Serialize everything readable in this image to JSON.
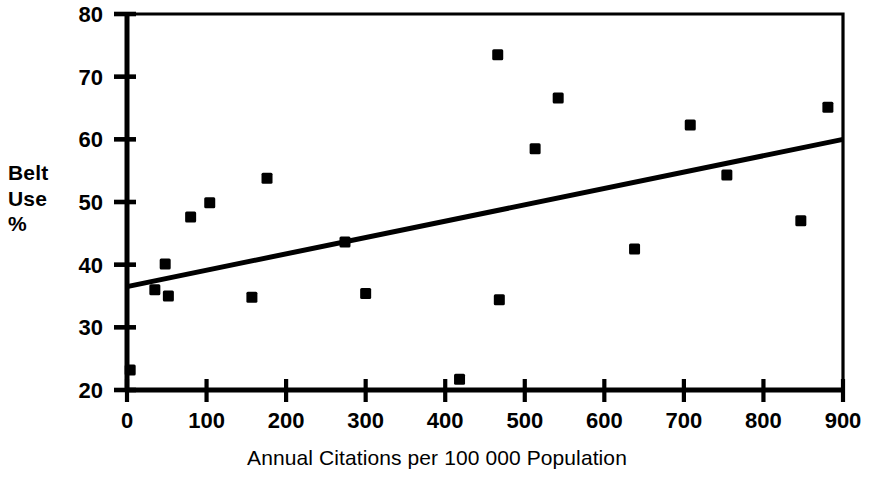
{
  "chart_data": {
    "type": "scatter",
    "title": "",
    "subtitle": "",
    "xlabel": "Annual Citations per 100 000 Population",
    "ylabel": "Belt Use %",
    "ylabel_lines": [
      "Belt",
      "Use",
      "%"
    ],
    "xlim": [
      0,
      900
    ],
    "ylim": [
      20,
      80
    ],
    "xticks": [
      0,
      100,
      200,
      300,
      400,
      500,
      600,
      700,
      800,
      900
    ],
    "yticks": [
      20,
      30,
      40,
      50,
      60,
      70,
      80
    ],
    "xtick_labels": [
      "0",
      "100",
      "200",
      "300",
      "400",
      "500",
      "600",
      "700",
      "800",
      "900"
    ],
    "ytick_labels": [
      "20",
      "30",
      "40",
      "50",
      "60",
      "70",
      "80"
    ],
    "grid": false,
    "legend": false,
    "legend_position": "none",
    "marker": "square",
    "marker_color": "#000000",
    "line_color": "#000000",
    "axis_color": "#000000",
    "background_color": "#ffffff",
    "series": [
      {
        "name": "Observations",
        "type": "scatter",
        "points": [
          {
            "x": 4,
            "y": 23.2
          },
          {
            "x": 35,
            "y": 36.0
          },
          {
            "x": 48,
            "y": 40.1
          },
          {
            "x": 52,
            "y": 35.0
          },
          {
            "x": 80,
            "y": 47.6
          },
          {
            "x": 104,
            "y": 49.9
          },
          {
            "x": 157,
            "y": 34.8
          },
          {
            "x": 176,
            "y": 53.8
          },
          {
            "x": 274,
            "y": 43.6
          },
          {
            "x": 300,
            "y": 35.4
          },
          {
            "x": 418,
            "y": 21.7
          },
          {
            "x": 466,
            "y": 73.5
          },
          {
            "x": 468,
            "y": 34.4
          },
          {
            "x": 513,
            "y": 58.5
          },
          {
            "x": 542,
            "y": 66.6
          },
          {
            "x": 638,
            "y": 42.5
          },
          {
            "x": 708,
            "y": 62.3
          },
          {
            "x": 754,
            "y": 54.3
          },
          {
            "x": 847,
            "y": 47.0
          },
          {
            "x": 881,
            "y": 65.1
          }
        ]
      },
      {
        "name": "Regression line",
        "type": "line",
        "points": [
          {
            "x": 0,
            "y": 36.5
          },
          {
            "x": 900,
            "y": 60.0
          }
        ]
      }
    ]
  }
}
